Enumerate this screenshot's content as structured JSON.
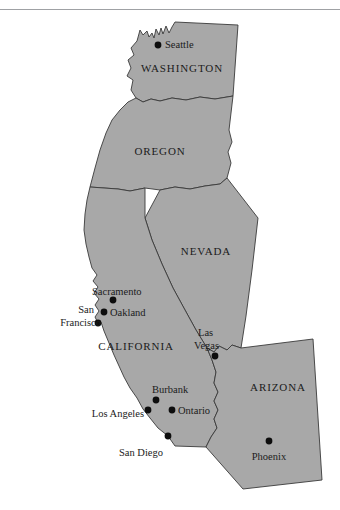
{
  "figure": {
    "background_color": "#ffffff",
    "land_fill_color": "#a8a8a8",
    "border_color": "#3a3a3a",
    "label_color": "#1b1b1b",
    "marker_color": "#0d0d0d",
    "rule_color": "#8e9094"
  },
  "map": {
    "rotation_degrees": -7,
    "states": [
      {
        "id": "washington",
        "label": "WASHINGTON",
        "label_x": 182,
        "label_y": 72
      },
      {
        "id": "oregon",
        "label": "OREGON",
        "label_x": 160,
        "label_y": 155
      },
      {
        "id": "nevada",
        "label": "NEVADA",
        "label_x": 206,
        "label_y": 255
      },
      {
        "id": "california",
        "label": "CALIFORNIA",
        "label_x": 136,
        "label_y": 350
      },
      {
        "id": "arizona",
        "label": "ARIZONA",
        "label_x": 278,
        "label_y": 391
      }
    ],
    "cities": [
      {
        "id": "seattle",
        "label": "Seattle",
        "dot_x": 158,
        "dot_y": 45,
        "label_x": 165,
        "label_y": 48,
        "anchor": "start",
        "lines": [
          "Seattle"
        ]
      },
      {
        "id": "sacramento",
        "label": "Sacramento",
        "dot_x": 113,
        "dot_y": 300,
        "label_x": 92,
        "label_y": 295,
        "anchor": "start",
        "lines": [
          "Sacramento"
        ]
      },
      {
        "id": "oakland",
        "label": "Oakland",
        "dot_x": 104,
        "dot_y": 312,
        "label_x": 110,
        "label_y": 316,
        "anchor": "start",
        "lines": [
          "Oakland"
        ]
      },
      {
        "id": "san-francisco",
        "label": "San Francisco",
        "dot_x": 98,
        "dot_y": 323,
        "label_x": 94,
        "label_y": 313,
        "anchor": "end",
        "lines": [
          "San",
          "Francisco"
        ]
      },
      {
        "id": "las-vegas",
        "label": "Las Vegas",
        "dot_x": 215,
        "dot_y": 356,
        "label_x": 198,
        "label_y": 336,
        "anchor": "start",
        "lines": [
          "Las",
          "Vegas"
        ]
      },
      {
        "id": "burbank",
        "label": "Burbank",
        "dot_x": 156,
        "dot_y": 400,
        "label_x": 152,
        "label_y": 393,
        "anchor": "start",
        "lines": [
          "Burbank"
        ]
      },
      {
        "id": "los-angeles",
        "label": "Los Angeles",
        "dot_x": 148,
        "dot_y": 410,
        "label_x": 144,
        "label_y": 417,
        "anchor": "end",
        "lines": [
          "Los Angeles"
        ]
      },
      {
        "id": "ontario",
        "label": "Ontario",
        "dot_x": 172,
        "dot_y": 410,
        "label_x": 178,
        "label_y": 414,
        "anchor": "start",
        "lines": [
          "Ontario"
        ]
      },
      {
        "id": "san-diego",
        "label": "San Diego",
        "dot_x": 168,
        "dot_y": 436,
        "label_x": 163,
        "label_y": 456,
        "anchor": "end",
        "lines": [
          "San Diego"
        ]
      },
      {
        "id": "phoenix",
        "label": "Phoenix",
        "dot_x": 269,
        "dot_y": 441,
        "label_x": 269,
        "label_y": 460,
        "anchor": "middle",
        "lines": [
          "Phoenix"
        ]
      }
    ]
  }
}
